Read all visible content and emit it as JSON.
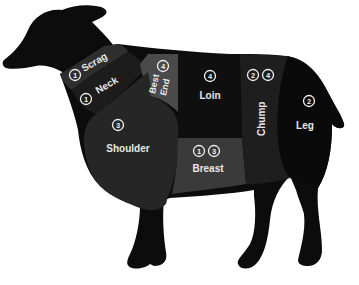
{
  "colors": {
    "background": "#ffffff",
    "silhouette": "#0c0c0c",
    "scrag": "#2e2e2e",
    "neck": "#1c1c1c",
    "best_end": "#4a4a4a",
    "shoulder": "#262626",
    "loin": "#0f0f0f",
    "breast": "#3a3a3a",
    "chump": "#1e1e1e",
    "leg": "#0a0a0a",
    "label_text": "#e8e8e8"
  },
  "cuts": [
    {
      "id": "scrag",
      "label": "Scrag",
      "numbers": [
        "1"
      ]
    },
    {
      "id": "neck",
      "label": "Neck",
      "numbers": [
        "1"
      ]
    },
    {
      "id": "best_end",
      "label_line1": "Best",
      "label_line2": "End",
      "numbers": [
        "4"
      ]
    },
    {
      "id": "loin",
      "label": "Loin",
      "numbers": [
        "4"
      ]
    },
    {
      "id": "chump",
      "label": "Chump",
      "numbers": [
        "2",
        "4"
      ]
    },
    {
      "id": "leg",
      "label": "Leg",
      "numbers": [
        "2"
      ]
    },
    {
      "id": "shoulder",
      "label": "Shoulder",
      "numbers": [
        "3"
      ]
    },
    {
      "id": "breast",
      "label": "Breast",
      "numbers": [
        "1",
        "3"
      ]
    }
  ]
}
